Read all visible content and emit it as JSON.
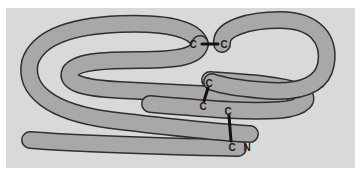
{
  "figure": {
    "type": "protein-chain-disulfide-diagram",
    "colors": {
      "background": "#ffffff",
      "panel": "#d9d9d9",
      "tube_fill": "#a8a8a8",
      "tube_outline": "#2f2f2f",
      "bond": "#111111",
      "label": "#1a1a1a"
    },
    "labels": {
      "c1": "C",
      "c2": "C",
      "c3": "C",
      "c4": "C",
      "c5": "C",
      "c6": "C",
      "n_terminus": "N"
    },
    "disulfide_bonds": [
      {
        "from": "c1",
        "to": "c2",
        "orientation": "horizontal"
      },
      {
        "from": "c3",
        "to": "c4",
        "orientation": "diagonal"
      },
      {
        "from": "c5",
        "to": "c6",
        "orientation": "vertical"
      }
    ]
  }
}
